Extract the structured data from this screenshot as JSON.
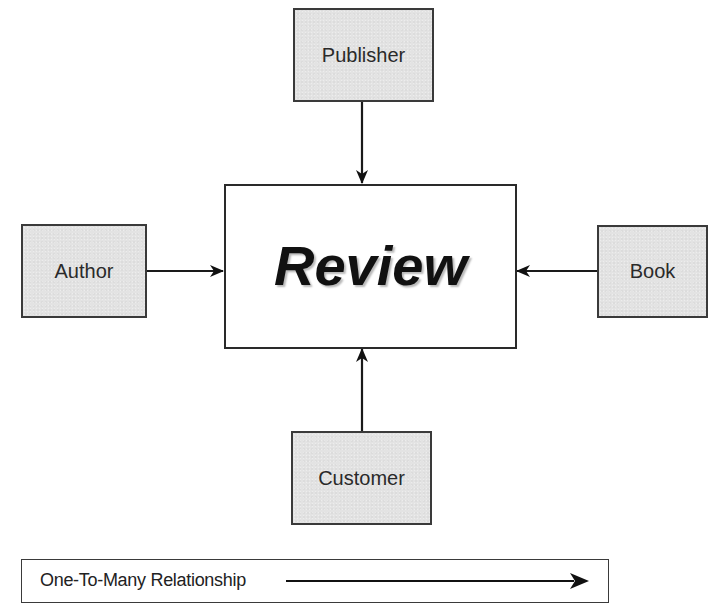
{
  "diagram": {
    "type": "entity-relationship",
    "central_entity": {
      "label": "Review"
    },
    "entities": [
      {
        "id": "publisher",
        "label": "Publisher",
        "position": "top"
      },
      {
        "id": "author",
        "label": "Author",
        "position": "left"
      },
      {
        "id": "book",
        "label": "Book",
        "position": "right"
      },
      {
        "id": "customer",
        "label": "Customer",
        "position": "bottom"
      }
    ],
    "relationships": [
      {
        "from": "Publisher",
        "to": "Review",
        "type": "one-to-many"
      },
      {
        "from": "Author",
        "to": "Review",
        "type": "one-to-many"
      },
      {
        "from": "Book",
        "to": "Review",
        "type": "one-to-many"
      },
      {
        "from": "Customer",
        "to": "Review",
        "type": "one-to-many"
      }
    ],
    "legend": {
      "label": "One-To-Many Relationship",
      "symbol": "arrow-right"
    },
    "colors": {
      "entity_fill": "#e3e3e3",
      "border": "#3a3a3a",
      "central_fill": "#ffffff",
      "text": "#2a2a2a",
      "arrow": "#111111"
    }
  }
}
